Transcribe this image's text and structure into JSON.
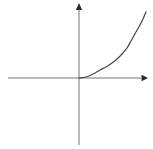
{
  "figure": {
    "background_color": "#ffffff",
    "width": 153,
    "height": 149,
    "axis_color": "#b9b9b9",
    "arrow_color": "#2b2b2b",
    "curve_color": "#4a4a4a",
    "axis_stroke_width": 1.1,
    "curve_stroke_width": 1.3
  },
  "chart_data": {
    "type": "line",
    "title": "",
    "subtitle": "",
    "xlabel": "",
    "ylabel": "",
    "grid": false,
    "legend": null,
    "legend_position": "none",
    "annotations": [],
    "xtick_labels": [],
    "ytick_labels": [],
    "xlim": [
      -4.0,
      3.5
    ],
    "ylim": [
      -3.6,
      4.0
    ],
    "origin_px": {
      "x": 79,
      "y": 78
    },
    "px_per_unit": {
      "x": 18.5,
      "y": 18.5
    },
    "axes": {
      "x_axis": {
        "y_px": 78,
        "x_start_px": 8,
        "x_end_px": 148,
        "arrow_at": "right"
      },
      "y_axis": {
        "x_px": 79,
        "y_start_px": 145,
        "y_end_px": 4,
        "arrow_at": "top"
      }
    },
    "series": [
      {
        "name": "exponential",
        "color": "#4a4a4a",
        "x": [
          0.0,
          0.5,
          1.0,
          1.4,
          1.7,
          2.0,
          2.2,
          2.4,
          2.6,
          2.8,
          3.0,
          3.2,
          3.4,
          3.6
        ],
        "y": [
          0.02,
          0.1,
          0.25,
          0.42,
          0.62,
          0.85,
          1.05,
          1.3,
          1.6,
          1.95,
          2.35,
          2.85,
          3.3,
          3.6
        ],
        "points_px": [
          [
            79,
            78
          ],
          [
            86,
            77
          ],
          [
            93,
            74
          ],
          [
            100,
            70
          ],
          [
            106,
            67
          ],
          [
            112,
            63
          ],
          [
            117,
            59
          ],
          [
            122,
            54
          ],
          [
            127,
            48
          ],
          [
            131,
            41
          ],
          [
            136,
            32
          ],
          [
            140,
            25
          ],
          [
            143,
            19
          ],
          [
            146,
            12
          ]
        ]
      }
    ]
  }
}
